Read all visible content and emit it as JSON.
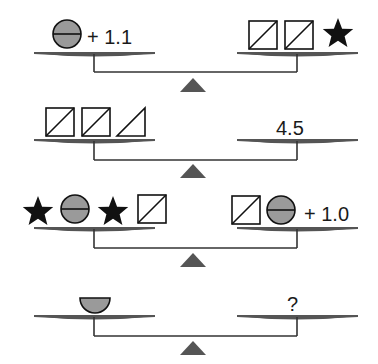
{
  "colors": {
    "pan": "#555555",
    "beam": "#333333",
    "fulcrum": "#555555",
    "circle_fill": "#9a9a9a",
    "stroke": "#111111",
    "star": "#111111"
  },
  "scales": [
    {
      "left": {
        "items": [
          "circle"
        ],
        "label": "+ 1.1"
      },
      "right": {
        "items": [
          "square",
          "square",
          "star"
        ],
        "label": ""
      }
    },
    {
      "left": {
        "items": [
          "square",
          "square",
          "triangle"
        ],
        "label": ""
      },
      "right": {
        "items": [],
        "label": "4.5"
      }
    },
    {
      "left": {
        "items": [
          "star",
          "circle",
          "star",
          "square"
        ],
        "label": ""
      },
      "right": {
        "items": [
          "square",
          "circle"
        ],
        "label": "+ 1.0"
      }
    },
    {
      "left": {
        "items": [
          "half-circle"
        ],
        "label": ""
      },
      "right": {
        "items": [],
        "label": "?"
      }
    }
  ],
  "labels": {
    "s1_left": "+ 1.1",
    "s2_right": "4.5",
    "s3_right": "+ 1.0",
    "s4_right": "?"
  }
}
